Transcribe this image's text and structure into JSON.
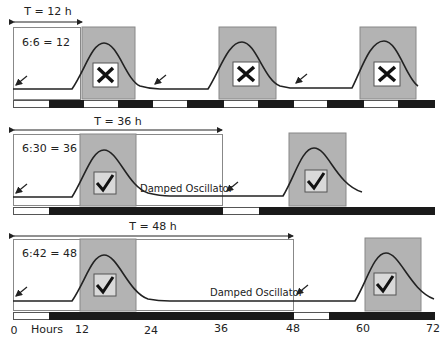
{
  "panels": [
    {
      "period_label": "T = 12 h",
      "ratio_label": "6:6 = 12",
      "outcome": "cross",
      "oscillator_label": ""
    },
    {
      "period_label": "T = 36 h",
      "ratio_label": "6:30 = 36",
      "outcome": "check",
      "oscillator_label": "Damped Oscillator"
    },
    {
      "period_label": "T = 48 h",
      "ratio_label": "6:42 = 48",
      "outcome": "check",
      "oscillator_label": "Damped Oscillator"
    }
  ],
  "axis": {
    "unit_label": "Hours",
    "ticks": [
      "0",
      "12",
      "24",
      "36",
      "48",
      "60",
      "72"
    ]
  },
  "colors": {
    "shade": "#b3b3b3",
    "dark": "#1a1a1a",
    "line": "#222222",
    "check_box": "#d9d9d9"
  }
}
